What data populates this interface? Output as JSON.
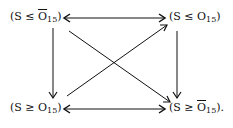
{
  "diagram": {
    "nodes": {
      "top_left": {
        "prefix": "(S ≤ ",
        "var": "O",
        "bar": true,
        "sub": "15",
        "suffix": ")"
      },
      "top_right": {
        "prefix": "(S ≤ ",
        "var": "O",
        "bar": false,
        "sub": "15",
        "suffix": ")"
      },
      "bottom_left": {
        "prefix": "(S ≥ ",
        "var": "O",
        "bar": false,
        "sub": "15",
        "suffix": ")"
      },
      "bottom_right": {
        "prefix": "(S ≥ ",
        "var": "O",
        "bar": true,
        "sub": "15",
        "suffix": ")."
      }
    },
    "edges": [
      {
        "from": "top_left",
        "to": "top_right",
        "type": "bidirectional"
      },
      {
        "from": "bottom_left",
        "to": "bottom_right",
        "type": "bidirectional"
      },
      {
        "from": "top_left",
        "to": "bottom_left",
        "type": "directed"
      },
      {
        "from": "top_right",
        "to": "bottom_right",
        "type": "directed"
      },
      {
        "from": "top_left",
        "to": "bottom_right",
        "type": "directed"
      },
      {
        "from": "bottom_left",
        "to": "top_right",
        "type": "directed"
      }
    ]
  }
}
